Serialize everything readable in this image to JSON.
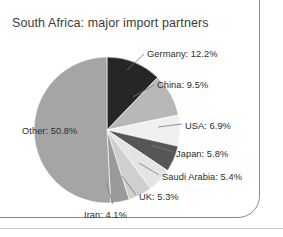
{
  "chart_title": "South Africa: major import partners",
  "frame": {
    "border_color": "#8a8a8a",
    "baseline_color": "#c9c9c9"
  },
  "chart_data": {
    "type": "pie",
    "title": "South Africa: major import partners",
    "xlabel": "",
    "ylabel": "",
    "units": "percent",
    "legend_position": "none",
    "labels_position": "outside-with-leader-lines",
    "grid": false,
    "start_angle_deg": 0,
    "direction": "clockwise",
    "categories": [
      "Germany",
      "China",
      "USA",
      "Japan",
      "Saudi Arabia",
      "UK",
      "Iran",
      "Other"
    ],
    "values": [
      12.2,
      9.5,
      6.9,
      5.8,
      5.4,
      5.3,
      4.1,
      50.8
    ],
    "slices": [
      {
        "name": "Germany",
        "value": 12.2,
        "label": "Germany: 12.2%",
        "color": "#262626",
        "leader": true
      },
      {
        "name": "China",
        "value": 9.5,
        "label": "China: 9.5%",
        "color": "#b8b8b8",
        "leader": true
      },
      {
        "name": "USA",
        "value": 6.9,
        "label": "USA: 6.9%",
        "color": "#f0f0f0",
        "leader": true
      },
      {
        "name": "Japan",
        "value": 5.8,
        "label": "Japan: 5.8%",
        "color": "#565656",
        "leader": true
      },
      {
        "name": "Saudi Arabia",
        "value": 5.4,
        "label": "Saudi Arabia: 5.4%",
        "color": "#e4e4e4",
        "leader": true
      },
      {
        "name": "UK",
        "value": 5.3,
        "label": "UK: 5.3%",
        "color": "#cfcfcf",
        "leader": true
      },
      {
        "name": "Iran",
        "value": 4.1,
        "label": "Iran: 4.1%",
        "color": "#9a9a9a",
        "leader": true
      },
      {
        "name": "Other",
        "value": 50.8,
        "label": "Other: 50.8%",
        "color": "#a5a5a5",
        "leader": false
      }
    ]
  }
}
